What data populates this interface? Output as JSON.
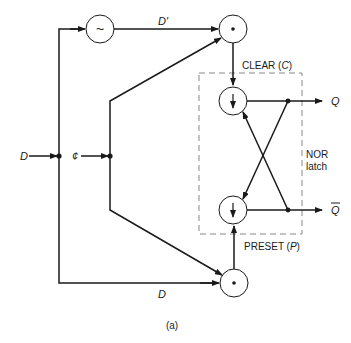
{
  "diagram": {
    "caption": "(a)",
    "inputs": {
      "data": "D",
      "clock": "¢"
    },
    "signals": {
      "delayed_data": "D′",
      "direct_data": "D"
    },
    "blocks": {
      "delay": {
        "symbol": "~"
      },
      "and_top": {
        "symbol": "•"
      },
      "and_bottom": {
        "symbol": "•"
      },
      "nor_top": {
        "symbol": "↓"
      },
      "nor_bottom": {
        "symbol": "↓"
      }
    },
    "labels": {
      "clear": "CLEAR (C)",
      "clear_prefix": "CLEAR (",
      "clear_var": "C",
      "clear_suffix": ")",
      "preset_prefix": "PRESET (",
      "preset_var": "P",
      "preset_suffix": ")",
      "latch_line1": "NOR",
      "latch_line2": "latch"
    },
    "outputs": {
      "q": "Q",
      "q_bar": "Q"
    },
    "colors": {
      "line": "#1a1a1a",
      "dashed_box": "#888888"
    }
  }
}
